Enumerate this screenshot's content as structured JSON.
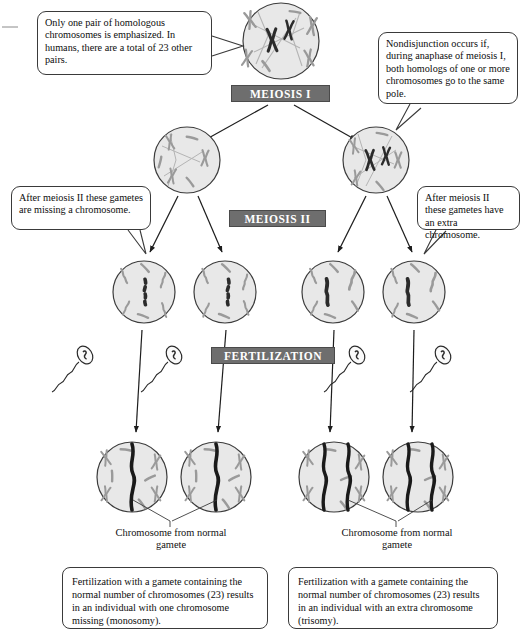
{
  "diagram": {
    "type": "biology-process-diagram"
  },
  "callouts": {
    "top_left": "Only one pair of homologous chromosomes is emphasized. In humans, there are a total of 23 other pairs.",
    "top_right": "Nondisjunction occurs if, during anaphase of meiosis I, both homologs of one or more chromosomes go to the same pole.",
    "mid_left": "After meiosis II these gametes are missing a chromosome.",
    "mid_right": "After meiosis II these gametes have an extra chromosome."
  },
  "stages": {
    "meiosis_1": "MEIOSIS I",
    "meiosis_2": "MEIOSIS II",
    "fertilization": "FERTILIZATION"
  },
  "leader_labels": {
    "left": "Chromosome from normal gamete",
    "right": "Chromosome from normal gamete"
  },
  "captions": {
    "monosomy": "Fertilization with a gamete containing the normal number of chromosomes (23) results in an individual with one chromosome missing (monosomy).",
    "trisomy": "Fertilization with a gamete containing the normal number of chromosomes (23) results in an individual with an extra chromosome (trisomy)."
  },
  "colors": {
    "cell_fill": "#e8e8e8",
    "cell_stroke": "#3c3c3c",
    "chromosome_normal": "#9a9a9a",
    "chromosome_emphasized": "#2b2b2b",
    "banner_bg": "#6e6e6e",
    "banner_text": "#ffffff",
    "callout_border": "#3a3a3a",
    "background": "#ffffff"
  },
  "cells": {
    "parent": {
      "label": "parent cell",
      "emphasized_chromosomes": 2
    },
    "meiosis1_left": {
      "label": "meiosis I daughter missing homologs",
      "emphasized_chromosomes": 0
    },
    "meiosis1_right": {
      "label": "meiosis I daughter with both homologs",
      "emphasized_chromosomes": 2
    },
    "gamete_1": {
      "label": "gamete missing a chromosome",
      "emphasized_chromosomes": 0,
      "outline_style": "dashed"
    },
    "gamete_2": {
      "label": "gamete missing a chromosome",
      "emphasized_chromosomes": 0,
      "outline_style": "dashed"
    },
    "gamete_3": {
      "label": "gamete with extra chromosome",
      "emphasized_chromosomes": 1,
      "outline_style": "solid"
    },
    "gamete_4": {
      "label": "gamete with extra chromosome",
      "emphasized_chromosomes": 1,
      "outline_style": "solid"
    },
    "zygote_1": {
      "label": "monosomic zygote",
      "emphasized_chromosomes": 1
    },
    "zygote_2": {
      "label": "monosomic zygote",
      "emphasized_chromosomes": 1
    },
    "zygote_3": {
      "label": "trisomic zygote",
      "emphasized_chromosomes": 2
    },
    "zygote_4": {
      "label": "trisomic zygote",
      "emphasized_chromosomes": 2
    }
  },
  "sperm": {
    "count": 4,
    "label": "sperm cell from normal gamete"
  }
}
